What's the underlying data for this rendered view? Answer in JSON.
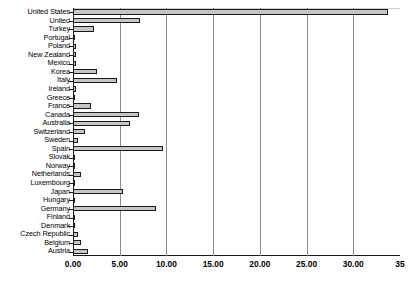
{
  "chart_data": {
    "type": "bar",
    "orientation": "horizontal",
    "title": "",
    "xlabel": "",
    "ylabel": "",
    "xlim": [
      0,
      35
    ],
    "xticks": [
      0,
      5,
      10,
      15,
      20,
      25,
      30,
      35
    ],
    "xtick_labels": [
      "0.00",
      "5.00",
      "10.00",
      "15.00",
      "20.00",
      "25.00",
      "30.00",
      "35"
    ],
    "grid": true,
    "legend": false,
    "bar_fill_color": "#c6c6c6",
    "bar_edge_color": "#1a1a1a",
    "categories": [
      "United States",
      "United",
      "Turkey",
      "Portugal",
      "Poland",
      "New Zealand",
      "Mexico",
      "Korea",
      "Italy",
      "Ireland",
      "Greece",
      "France",
      "Canada",
      "Australia",
      "Switzerland",
      "Sweden",
      "Spain",
      "Slovak",
      "Norway",
      "Netherlands",
      "Luxembourg",
      "Japan",
      "Hungary",
      "Germany",
      "Finland",
      "Denmark",
      "Czech Republic",
      "Belgium",
      "Austria"
    ],
    "values": [
      33.7,
      7.2,
      2.2,
      0.15,
      0.3,
      0.3,
      0.3,
      2.6,
      4.7,
      0.35,
      0.05,
      1.9,
      7.1,
      6.1,
      1.3,
      0.5,
      9.6,
      0.1,
      0.2,
      0.85,
      0.08,
      5.4,
      0.2,
      8.9,
      0.1,
      0.2,
      0.55,
      0.9,
      1.6
    ]
  }
}
